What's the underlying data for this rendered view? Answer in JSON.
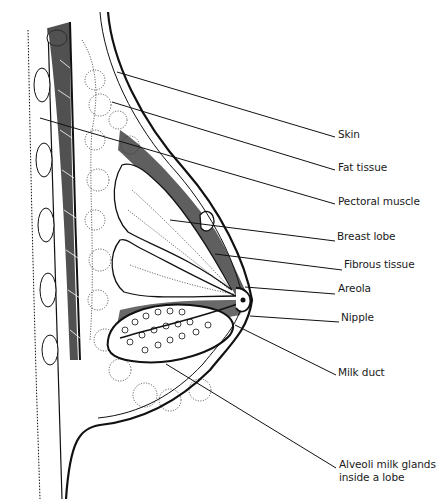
{
  "figure": {
    "ink_color": "#111111",
    "background": "#ffffff"
  },
  "labels": [
    {
      "id": "skin",
      "text": "Skin",
      "x": 338,
      "y": 134,
      "line": [
        [
          117,
          72
        ],
        [
          335,
          137
        ]
      ]
    },
    {
      "id": "fat-tissue",
      "text": "Fat tissue",
      "x": 338,
      "y": 167,
      "line": [
        [
          112,
          102
        ],
        [
          335,
          170
        ]
      ]
    },
    {
      "id": "pectoral-muscle",
      "text": "Pectoral muscle",
      "x": 338,
      "y": 201,
      "line": [
        [
          40,
          118
        ],
        [
          335,
          204
        ]
      ]
    },
    {
      "id": "breast-lobe",
      "text": "Breast lobe",
      "x": 337,
      "y": 236,
      "line": [
        [
          170,
          220
        ],
        [
          335,
          241
        ]
      ]
    },
    {
      "id": "fibrous-tissue",
      "text": "Fibrous tissue",
      "x": 344,
      "y": 264,
      "line": [
        [
          215,
          254
        ],
        [
          342,
          270
        ]
      ]
    },
    {
      "id": "areola",
      "text": "Areola",
      "x": 338,
      "y": 288,
      "line": [
        [
          245,
          287
        ],
        [
          335,
          294
        ]
      ]
    },
    {
      "id": "nipple",
      "text": "Nipple",
      "x": 341,
      "y": 317,
      "line": [
        [
          250,
          316
        ],
        [
          339,
          322
        ]
      ]
    },
    {
      "id": "milk-duct",
      "text": "Milk duct",
      "x": 338,
      "y": 372,
      "line": [
        [
          235,
          325
        ],
        [
          336,
          375
        ]
      ]
    },
    {
      "id": "alveoli",
      "text": "Alveoli milk glands",
      "text2": "inside a lobe",
      "x": 339,
      "y": 464,
      "line": [
        [
          166,
          364
        ],
        [
          336,
          468
        ]
      ]
    }
  ]
}
